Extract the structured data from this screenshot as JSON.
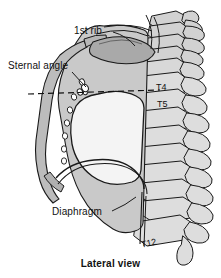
{
  "figure": {
    "caption": "Lateral view",
    "labels": {
      "first_rib": "1st rib",
      "sternal_angle": "Sternal angle",
      "diaphragm": "Diaphragm"
    },
    "vertebra_labels": {
      "t4": "T4",
      "t5": "T5",
      "t12": "T12"
    },
    "colors": {
      "outline": "#1a1a1a",
      "background": "#ffffff",
      "lung_field": "#f2f2f2",
      "thoracic_wall_shade": "#c9c9c9",
      "rib_shade": "#b3b3b3",
      "vertebra_fill": "#d8d8d8",
      "label_text": "#111111"
    },
    "annotations": [
      {
        "name": "sternal-angle-plane",
        "style": "dashed",
        "orientation": "horizontal"
      },
      {
        "name": "first-rib-leader",
        "style": "solid"
      },
      {
        "name": "sternal-angle-leader",
        "style": "solid"
      },
      {
        "name": "diaphragm-leader",
        "style": "solid"
      }
    ]
  }
}
